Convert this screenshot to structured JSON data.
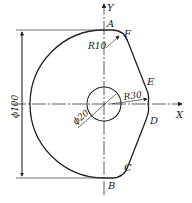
{
  "diagram": {
    "axes": {
      "x_label": "X",
      "y_label": "Y"
    },
    "points": {
      "A": "A",
      "B": "B",
      "C": "C",
      "D": "D",
      "E": "E",
      "F": "F"
    },
    "dimensions": {
      "outer_diameter": "ϕ100",
      "hole_diameter": "ϕ20",
      "radius_top": "R10",
      "radius_right": "R30"
    },
    "colors": {
      "line": "#222222",
      "background": "#ffffff"
    }
  }
}
